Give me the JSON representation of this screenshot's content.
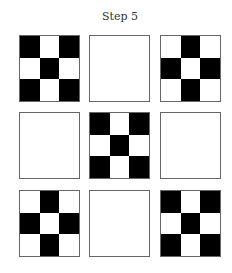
{
  "title": "Step 5",
  "colors": {
    "filled": "#000000",
    "empty": "#ffffff",
    "border": "#666666"
  },
  "grid": {
    "rows": 3,
    "cols": 3,
    "panels": [
      {
        "row": 0,
        "col": 0,
        "pattern": "x",
        "cells": [
          1,
          0,
          1,
          0,
          1,
          0,
          1,
          0,
          1
        ]
      },
      {
        "row": 0,
        "col": 1,
        "pattern": "empty",
        "cells": [
          0,
          0,
          0,
          0,
          0,
          0,
          0,
          0,
          0
        ]
      },
      {
        "row": 0,
        "col": 2,
        "pattern": "plus",
        "cells": [
          0,
          1,
          0,
          1,
          0,
          1,
          0,
          1,
          0
        ]
      },
      {
        "row": 1,
        "col": 0,
        "pattern": "empty",
        "cells": [
          0,
          0,
          0,
          0,
          0,
          0,
          0,
          0,
          0
        ]
      },
      {
        "row": 1,
        "col": 1,
        "pattern": "x",
        "cells": [
          1,
          0,
          1,
          0,
          1,
          0,
          1,
          0,
          1
        ]
      },
      {
        "row": 1,
        "col": 2,
        "pattern": "empty",
        "cells": [
          0,
          0,
          0,
          0,
          0,
          0,
          0,
          0,
          0
        ]
      },
      {
        "row": 2,
        "col": 0,
        "pattern": "plus",
        "cells": [
          0,
          1,
          0,
          1,
          0,
          1,
          0,
          1,
          0
        ]
      },
      {
        "row": 2,
        "col": 1,
        "pattern": "empty",
        "cells": [
          0,
          0,
          0,
          0,
          0,
          0,
          0,
          0,
          0
        ]
      },
      {
        "row": 2,
        "col": 2,
        "pattern": "x",
        "cells": [
          1,
          0,
          1,
          0,
          1,
          0,
          1,
          0,
          1
        ]
      }
    ]
  }
}
